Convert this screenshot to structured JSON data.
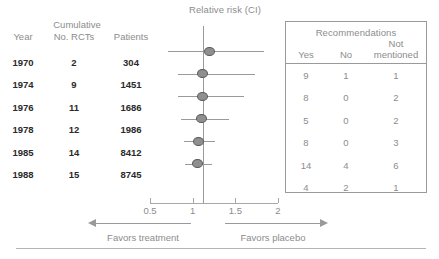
{
  "chart_data": {
    "type": "forest",
    "title": "Relative risk (CI)",
    "xlabel": "",
    "ylabel": "",
    "xscale": "log",
    "xlim": [
      0.5,
      2.0
    ],
    "null_value": 1,
    "ticks": [
      {
        "value": 0.5,
        "label": "0.5"
      },
      {
        "value": 1,
        "label": "1"
      },
      {
        "value": 1.5,
        "label": "1.5"
      },
      {
        "value": 2,
        "label": "2"
      }
    ],
    "grid": false,
    "left_axis_caption": "Favors treatment",
    "right_axis_caption": "Favors placebo",
    "columns": [
      "Year",
      "No. RCTs",
      "Patients",
      "Yes",
      "No",
      "Not mentioned"
    ],
    "rows": [
      {
        "year": "1970",
        "rcts": "2",
        "patients": "304",
        "rr": 1.2,
        "ci_low": 0.71,
        "ci_high": 1.84,
        "yes": "9",
        "no": "1",
        "not_mentioned": "1"
      },
      {
        "year": "1974",
        "rcts": "9",
        "patients": "1451",
        "rr": 1.11,
        "ci_low": 0.83,
        "ci_high": 1.73,
        "yes": "8",
        "no": "0",
        "not_mentioned": "2"
      },
      {
        "year": "1976",
        "rcts": "11",
        "patients": "1686",
        "rr": 1.11,
        "ci_low": 0.83,
        "ci_high": 1.6,
        "yes": "5",
        "no": "0",
        "not_mentioned": "2"
      },
      {
        "year": "1978",
        "rcts": "12",
        "patients": "1986",
        "rr": 1.1,
        "ci_low": 0.86,
        "ci_high": 1.42,
        "yes": "8",
        "no": "0",
        "not_mentioned": "3"
      },
      {
        "year": "1985",
        "rcts": "14",
        "patients": "8412",
        "rr": 1.07,
        "ci_low": 0.9,
        "ci_high": 1.26,
        "yes": "14",
        "no": "4",
        "not_mentioned": "6"
      },
      {
        "year": "1988",
        "rcts": "15",
        "patients": "8745",
        "rr": 1.06,
        "ci_low": 0.91,
        "ci_high": 1.23,
        "yes": "4",
        "no": "2",
        "not_mentioned": "1"
      }
    ],
    "marker_color": "#8f8f8f",
    "line_color": "#9a9a9a",
    "text_color": "#8c8c8c",
    "value_color": "#2a2a2a"
  },
  "left_table": {
    "group_header": "Cumulative",
    "headers": {
      "year": "Year",
      "rcts": "No. RCTs",
      "patients": "Patients"
    }
  },
  "recommendations": {
    "title": "Recommendations",
    "headers": {
      "yes": "Yes",
      "no": "No",
      "not_mentioned_line1": "Not",
      "not_mentioned_line2": "mentioned"
    }
  }
}
